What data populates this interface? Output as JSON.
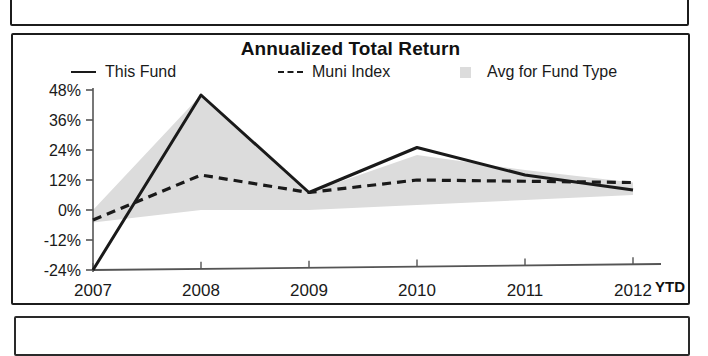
{
  "chart_card": {
    "title": "Annualized Total Return",
    "legend": [
      {
        "label": "This Fund",
        "marker": "solid-line-key",
        "color": "#1a1a1a"
      },
      {
        "label": "Muni Index",
        "marker": "dashed-line-key",
        "color": "#1a1a1a"
      },
      {
        "label": "Avg for Fund Type",
        "marker": "area-swatch-key",
        "color": "#dcdcdc"
      }
    ],
    "axis_note": "YTD"
  },
  "chart_data": {
    "type": "line",
    "title": "Annualized Total Return",
    "xlabel": "",
    "ylabel": "",
    "categories": [
      "2007",
      "2008",
      "2009",
      "2010",
      "2011",
      "2012"
    ],
    "x_tick_labels": [
      "2007",
      "2008",
      "2009",
      "2010",
      "2011",
      "2012"
    ],
    "y_tick_labels": [
      "48%",
      "36%",
      "24%",
      "12%",
      "0%",
      "-12%",
      "-24%"
    ],
    "y_ticks": [
      48,
      36,
      24,
      12,
      0,
      -12,
      -24
    ],
    "ylim": [
      -24,
      48
    ],
    "grid": false,
    "legend_position": "top",
    "value_unit": "percent",
    "series": [
      {
        "name": "This Fund",
        "style": "solid",
        "color": "#1a1a1a",
        "values": [
          -24,
          46,
          7,
          25,
          14,
          8
        ]
      },
      {
        "name": "Muni Index",
        "style": "dashed",
        "color": "#1a1a1a",
        "values": [
          -4,
          14,
          7,
          12,
          11.5,
          11
        ]
      },
      {
        "name": "Avg for Fund Type",
        "style": "shaded-band",
        "color": "#dcdcdc",
        "upper_values": [
          0,
          46,
          7,
          22,
          16,
          11
        ],
        "lower_values": [
          -5,
          0,
          0,
          2,
          4,
          6
        ]
      }
    ],
    "annotations": [
      {
        "text": "YTD",
        "position": "after-last-x-tick"
      }
    ]
  }
}
